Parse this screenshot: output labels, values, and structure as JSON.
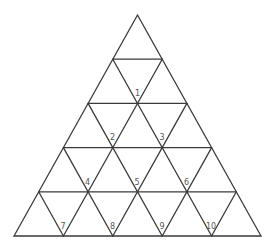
{
  "diagram": {
    "type": "triangular-grid",
    "rows": 5,
    "colors": {
      "line": "#3a3a3a",
      "label": "#555555",
      "background": "#ffffff"
    },
    "labels": [
      {
        "id": "1",
        "text": "1"
      },
      {
        "id": "2",
        "text": "2"
      },
      {
        "id": "3",
        "text": "3"
      },
      {
        "id": "4",
        "text": "4"
      },
      {
        "id": "5",
        "text": "5"
      },
      {
        "id": "6",
        "text": "6"
      },
      {
        "id": "7",
        "text": "7"
      },
      {
        "id": "8",
        "text": "8"
      },
      {
        "id": "9",
        "text": "9"
      },
      {
        "id": "10",
        "text": "10"
      }
    ]
  }
}
